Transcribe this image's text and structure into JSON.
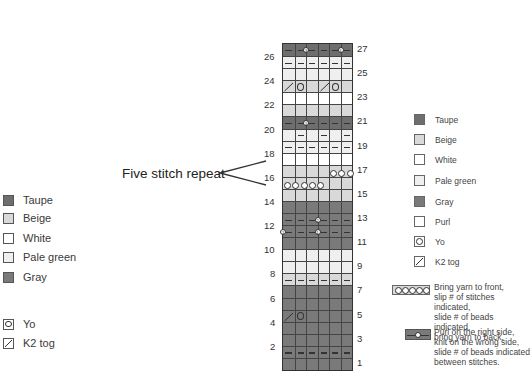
{
  "colors": {
    "taupe": "#6e6e6e",
    "beige": "#d9d9d9",
    "white": "#ffffff",
    "pale_green": "#efefef",
    "gray": "#7a7a7a"
  },
  "repeat_label": "Five stitch repeat",
  "left_legend": {
    "items": [
      {
        "label": "Taupe",
        "color": "#6e6e6e",
        "icon": "swatch"
      },
      {
        "label": "Beige",
        "color": "#d9d9d9",
        "icon": "swatch"
      },
      {
        "label": "White",
        "color": "#ffffff",
        "icon": "swatch"
      },
      {
        "label": "Pale green",
        "color": "#efefef",
        "icon": "swatch"
      },
      {
        "label": "Gray",
        "color": "#7a7a7a",
        "icon": "swatch"
      }
    ],
    "symbols": [
      {
        "label": "Yo",
        "icon": "yo-circle-icon"
      },
      {
        "label": "K2 tog",
        "icon": "k2tog-slash-icon"
      }
    ]
  },
  "right_legend": {
    "items": [
      {
        "label": "Taupe",
        "color": "#6e6e6e"
      },
      {
        "label": "Beige",
        "color": "#d9d9d9"
      },
      {
        "label": "White",
        "color": "#ffffff"
      },
      {
        "label": "Pale green",
        "color": "#efefef"
      },
      {
        "label": "Gray",
        "color": "#7a7a7a"
      },
      {
        "label": "Purl",
        "color": "#ffffff"
      },
      {
        "label": "Yo",
        "icon": "yo-circle-icon"
      },
      {
        "label": "K2 tog",
        "icon": "k2tog-slash-icon"
      }
    ],
    "notes": [
      {
        "text": "Bring yarn to front,\nslip # of stitches indicated,\nslide # of beads indicated,\nbring yarn to back.",
        "icon": "bead-slip-icon"
      },
      {
        "text": "Purl on the right side,\nknit on the wrong side,\nslide # of beads indicated\nbetween stitches.",
        "icon": "bead-purl-icon"
      }
    ]
  },
  "chart": {
    "columns": 6,
    "rows": [
      {
        "n": 27,
        "color": "taupe",
        "purl": [
          1,
          2,
          3,
          4,
          5,
          6
        ],
        "beads": [
          {
            "after": 2,
            "num": "3"
          },
          {
            "after": 5,
            "num": "1"
          }
        ]
      },
      {
        "n": 26,
        "color": "pale_green",
        "purl": [
          1,
          2,
          3,
          4,
          5,
          6
        ]
      },
      {
        "n": 25,
        "color": "pale_green"
      },
      {
        "n": 24,
        "color": "beige",
        "k2tog": [
          1,
          4
        ],
        "yo": [
          2,
          5
        ]
      },
      {
        "n": 23,
        "color": "white"
      },
      {
        "n": 22,
        "color": "beige"
      },
      {
        "n": 21,
        "color": "taupe",
        "purl": [
          1,
          2,
          3,
          4,
          5,
          6
        ],
        "beads": [
          {
            "after": 2,
            "num": "1"
          }
        ]
      },
      {
        "n": 20,
        "color": "pale_green",
        "purl": [
          2,
          4,
          6
        ]
      },
      {
        "n": 19,
        "color": "pale_green",
        "purl": [
          1,
          2,
          3,
          4,
          5,
          6
        ]
      },
      {
        "n": 18,
        "color": "white"
      },
      {
        "n": 17,
        "color": "beige",
        "slip": {
          "start": 5,
          "count": 3
        }
      },
      {
        "n": 16,
        "color": "beige",
        "slip": {
          "start": 1,
          "count": 5
        }
      },
      {
        "n": 15,
        "color": "beige"
      },
      {
        "n": 14,
        "color": "gray"
      },
      {
        "n": 13,
        "color": "gray",
        "purl": [
          1,
          2,
          3,
          4,
          5,
          6
        ],
        "beads": [
          {
            "after": 3,
            "num": "2"
          }
        ]
      },
      {
        "n": 12,
        "color": "gray",
        "purl": [
          1,
          2,
          3,
          4,
          5,
          6
        ],
        "beads": [
          {
            "after": 0,
            "num": "1"
          },
          {
            "after": 3,
            "num": "1"
          }
        ]
      },
      {
        "n": 11,
        "color": "gray"
      },
      {
        "n": 10,
        "color": "pale_green"
      },
      {
        "n": 9,
        "color": "pale_green"
      },
      {
        "n": 8,
        "color": "beige",
        "purl": [
          1,
          2,
          3,
          4,
          5,
          6
        ]
      },
      {
        "n": 7,
        "color": "gray"
      },
      {
        "n": 6,
        "color": "gray"
      },
      {
        "n": 5,
        "color": "gray",
        "k2tog": [
          1
        ],
        "yo": [
          2
        ]
      },
      {
        "n": 4,
        "color": "gray"
      },
      {
        "n": 3,
        "color": "gray"
      },
      {
        "n": 2,
        "color": "gray",
        "purl": [
          1,
          2,
          3,
          4,
          5,
          6
        ]
      },
      {
        "n": 1,
        "color": "gray"
      }
    ]
  }
}
